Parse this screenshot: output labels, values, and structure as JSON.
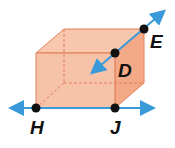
{
  "diagram": {
    "points": {
      "H": {
        "label": "H",
        "x": 36,
        "y": 108
      },
      "J": {
        "label": "J",
        "x": 115,
        "y": 108
      },
      "D": {
        "label": "D",
        "x": 115,
        "y": 53
      },
      "E": {
        "label": "E",
        "x": 144,
        "y": 29
      }
    },
    "labels": {
      "H": "H",
      "J": "J",
      "D": "D",
      "E": "E"
    },
    "colors": {
      "prism_fill": "#f5b89a",
      "prism_edge": "#e2805a",
      "line": "#3a9ad9",
      "point": "#111111"
    }
  }
}
